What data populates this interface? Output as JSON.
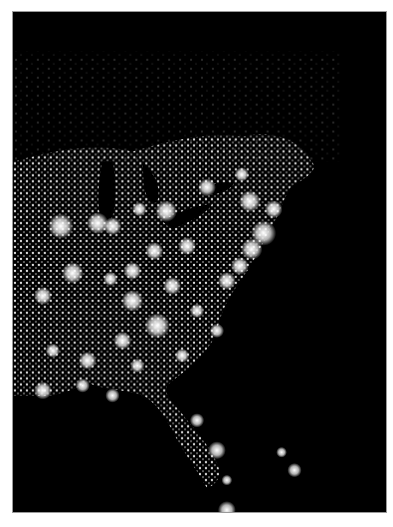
{
  "figure": {
    "background_color": "#000000",
    "light_color": "#ffffff",
    "border_color": "#9a9a9a",
    "lakes": [
      {
        "name": "lake-michigan",
        "path": "M90 150 C86 170 84 190 88 205 C92 212 98 212 100 204 C104 190 104 170 100 150 Z"
      },
      {
        "name": "lake-huron",
        "path": "M130 150 C140 160 150 175 145 190 C140 195 134 188 132 176 Z"
      },
      {
        "name": "lake-erie",
        "path": "M150 210 C165 200 185 195 200 192 C198 200 180 210 160 218 Z"
      },
      {
        "name": "lake-ontario",
        "path": "M190 178 C200 172 214 170 222 172 C218 180 204 184 192 184 Z"
      }
    ],
    "cities": [
      {
        "x": 48,
        "y": 215,
        "r": 7
      },
      {
        "x": 85,
        "y": 212,
        "r": 6
      },
      {
        "x": 100,
        "y": 215,
        "r": 5
      },
      {
        "x": 127,
        "y": 198,
        "r": 4
      },
      {
        "x": 154,
        "y": 200,
        "r": 6
      },
      {
        "x": 195,
        "y": 176,
        "r": 5
      },
      {
        "x": 230,
        "y": 163,
        "r": 4
      },
      {
        "x": 238,
        "y": 190,
        "r": 6
      },
      {
        "x": 262,
        "y": 198,
        "r": 5
      },
      {
        "x": 252,
        "y": 222,
        "r": 7
      },
      {
        "x": 240,
        "y": 238,
        "r": 6
      },
      {
        "x": 228,
        "y": 255,
        "r": 5
      },
      {
        "x": 215,
        "y": 270,
        "r": 5
      },
      {
        "x": 175,
        "y": 235,
        "r": 5
      },
      {
        "x": 142,
        "y": 240,
        "r": 5
      },
      {
        "x": 120,
        "y": 260,
        "r": 5
      },
      {
        "x": 98,
        "y": 268,
        "r": 4
      },
      {
        "x": 60,
        "y": 262,
        "r": 6
      },
      {
        "x": 30,
        "y": 285,
        "r": 5
      },
      {
        "x": 120,
        "y": 290,
        "r": 6
      },
      {
        "x": 160,
        "y": 275,
        "r": 5
      },
      {
        "x": 145,
        "y": 315,
        "r": 7
      },
      {
        "x": 110,
        "y": 330,
        "r": 5
      },
      {
        "x": 75,
        "y": 350,
        "r": 5
      },
      {
        "x": 40,
        "y": 340,
        "r": 4
      },
      {
        "x": 185,
        "y": 300,
        "r": 4
      },
      {
        "x": 205,
        "y": 320,
        "r": 4
      },
      {
        "x": 170,
        "y": 345,
        "r": 4
      },
      {
        "x": 125,
        "y": 355,
        "r": 4
      },
      {
        "x": 30,
        "y": 380,
        "r": 5
      },
      {
        "x": 70,
        "y": 375,
        "r": 4
      },
      {
        "x": 100,
        "y": 385,
        "r": 4
      },
      {
        "x": 185,
        "y": 410,
        "r": 4
      },
      {
        "x": 205,
        "y": 440,
        "r": 5
      },
      {
        "x": 215,
        "y": 470,
        "r": 3
      },
      {
        "x": 270,
        "y": 442,
        "r": 3
      },
      {
        "x": 283,
        "y": 460,
        "r": 4
      },
      {
        "x": 215,
        "y": 500,
        "r": 5
      }
    ],
    "land_regions": [
      {
        "name": "eastern-us-landmass",
        "path": "M0 150 C40 140 80 130 120 140 C160 128 200 120 230 125 C260 118 290 128 300 150 C310 158 290 170 280 175 C270 190 268 205 260 215 C250 235 240 255 225 275 C215 290 210 300 205 320 C200 335 190 345 180 355 C172 362 160 370 155 375 C150 385 165 395 175 410 C188 425 200 440 206 455 C210 465 205 475 195 478 C185 460 170 440 160 420 C150 400 140 390 130 385 C110 378 90 380 75 372 C60 380 40 388 20 385 L0 385 Z"
      }
    ]
  },
  "caption": {
    "text_visible": "",
    "truncated": true,
    "color": "#b8b8b8"
  }
}
